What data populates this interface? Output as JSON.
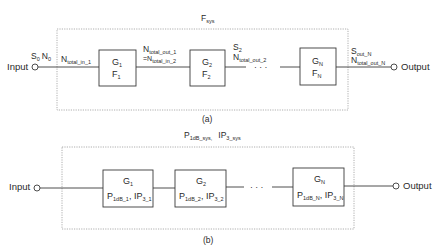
{
  "panel_a": {
    "caption": "(a)",
    "system_label": {
      "main": "F",
      "sub": "sys"
    },
    "input": {
      "label": "Input",
      "signal": {
        "S": "S",
        "S_sub": "0",
        "N": "N",
        "N_sub": "0"
      }
    },
    "output": {
      "label": "Output"
    },
    "edge_labels": {
      "in_1": {
        "main": "N",
        "sub": "total_in_1"
      },
      "out_1_line1": {
        "main": "N",
        "sub": "total_out_1"
      },
      "out_1_line2": {
        "prefix": "=N",
        "sub": "total_in_2"
      },
      "s2": {
        "main": "S",
        "sub": "2"
      },
      "out_2": {
        "main": "N",
        "sub": "total_out_2"
      },
      "sout_n": {
        "main": "S",
        "sub": "out_N"
      },
      "nout_n": {
        "main": "N",
        "sub": "total_out_N"
      }
    },
    "ellipsis": "· · ·",
    "blocks": [
      {
        "g": "G",
        "g_sub": "1",
        "f": "F",
        "f_sub": "1"
      },
      {
        "g": "G",
        "g_sub": "2",
        "f": "F",
        "f_sub": "2"
      },
      {
        "g": "G",
        "g_sub": "N",
        "f": "F",
        "f_sub": "N"
      }
    ]
  },
  "panel_b": {
    "caption": "(b)",
    "system_label": {
      "p": "P",
      "p_sub": "1dB_sys,",
      "ip": "IP",
      "ip_sub": "3_sys"
    },
    "input": {
      "label": "Input"
    },
    "output": {
      "label": "Output"
    },
    "ellipsis": "· · ·",
    "blocks": [
      {
        "g": "G",
        "g_sub": "1",
        "p": "P",
        "p_sub": "1dB_1",
        "ip": ", IP",
        "ip_sub": "3_1"
      },
      {
        "g": "G",
        "g_sub": "2",
        "p": "P",
        "p_sub": "1dB_2",
        "ip": ", IP",
        "ip_sub": "3_2"
      },
      {
        "g": "G",
        "g_sub": "N",
        "p": "P",
        "p_sub": "1dB_N",
        "ip": ", IP",
        "ip_sub": "3_N"
      }
    ]
  },
  "colors": {
    "line": "#3a3a3a",
    "dashed": "#9a9a9a",
    "text": "#2a2a2a"
  }
}
